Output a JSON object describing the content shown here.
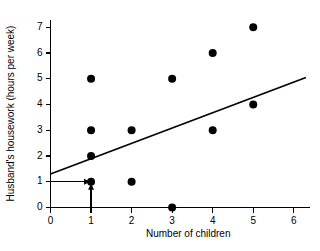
{
  "chart_data": {
    "type": "scatter",
    "title": "",
    "xlabel": "Number of children",
    "ylabel": "Husband's housework (hours per week)",
    "xlim": [
      0,
      6.4
    ],
    "ylim": [
      0,
      7.3
    ],
    "xticks": [
      0,
      1,
      2,
      3,
      4,
      5,
      6
    ],
    "xtick_labels": [
      "0",
      "1",
      "2",
      "3",
      "4",
      "5",
      "6"
    ],
    "yticks": [
      0,
      1,
      2,
      3,
      4,
      5,
      6,
      7
    ],
    "ytick_labels": [
      "0",
      "1",
      "2",
      "3",
      "4",
      "5",
      "6",
      "7"
    ],
    "grid": false,
    "legend": false,
    "points": [
      {
        "x": 1,
        "y": 5
      },
      {
        "x": 1,
        "y": 3
      },
      {
        "x": 1,
        "y": 2
      },
      {
        "x": 1,
        "y": 1
      },
      {
        "x": 2,
        "y": 3
      },
      {
        "x": 2,
        "y": 1
      },
      {
        "x": 3,
        "y": 5
      },
      {
        "x": 3,
        "y": 0
      },
      {
        "x": 4,
        "y": 6
      },
      {
        "x": 4,
        "y": 3
      },
      {
        "x": 5,
        "y": 7
      },
      {
        "x": 5,
        "y": 4
      }
    ],
    "marker_color": "#000000",
    "marker_size_px": 4.0,
    "fit_line": {
      "name": "regression line",
      "x_start": 0,
      "y_start": 1.3,
      "x_end": 6.3,
      "y_end": 5.05,
      "color": "#000000"
    },
    "annotations": [
      {
        "name": "horizontal-reference-arrow",
        "description": "arrow from y-axis at y=1 pointing right to point (1,1)",
        "from_x": 0,
        "from_y": 1,
        "to_x": 1,
        "to_y": 1
      },
      {
        "name": "vertical-reference-arrow",
        "description": "arrow from x-axis at x=1 pointing up to point (1,1)",
        "from_x": 1,
        "from_y": 0,
        "to_x": 1,
        "to_y": 1
      }
    ],
    "axis_color": "#000000",
    "background_color": "#ffffff"
  }
}
